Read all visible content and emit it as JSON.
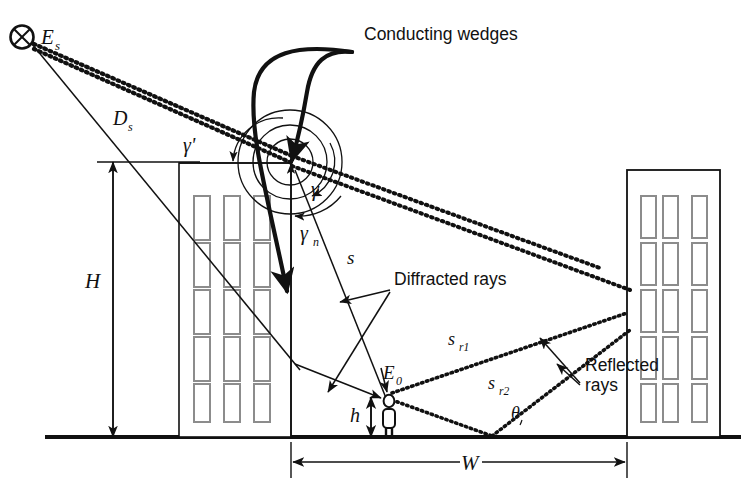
{
  "figure": {
    "kind": "ray-propagation-diagram",
    "title": "",
    "background_color": "#ffffff",
    "line_color": "#111111",
    "window_color": "#8c8c8c"
  },
  "annotations": {
    "conducting_wedges": "Conducting wedges",
    "diffracted_rays": "Diffracted rays",
    "reflected_rays_line1": "Reflected",
    "reflected_rays_line2": "rays"
  },
  "labels": {
    "source": "E",
    "source_sub": "s",
    "source_distance": "D",
    "source_distance_sub": "s",
    "field_point": "E",
    "field_point_sub": "0",
    "gamma_prime": "γ'",
    "gamma": "γ",
    "gamma_n": "γ",
    "gamma_n_sub": "n",
    "s_ray": "s",
    "s_r1": "s",
    "s_r1_sub": "r1",
    "s_r2": "s",
    "s_r2_sub": "r2",
    "theta": "θ",
    "height_H": "H",
    "height_h": "h",
    "width_W": "W"
  },
  "elements": {
    "source_marker": "crossed-circle",
    "receiver_marker": "person-figure",
    "buildings": [
      {
        "name": "left-building",
        "x": 179,
        "y": 163,
        "w": 112,
        "h": 273,
        "window_rows": 5,
        "window_cols": 3
      },
      {
        "name": "right-building",
        "x": 627,
        "y": 170,
        "w": 93,
        "h": 266,
        "window_rows": 5,
        "window_cols": 3
      }
    ],
    "ground_line_y": 437,
    "dimension_H": {
      "from_y": 162,
      "to_y": 437,
      "x": 113
    },
    "dimension_h": {
      "from_y": 397,
      "to_y": 437,
      "x": 370
    },
    "dimension_W": {
      "from_x": 291,
      "to_x": 627,
      "y": 462
    }
  }
}
